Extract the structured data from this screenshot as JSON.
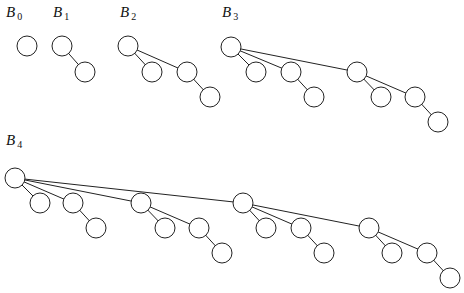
{
  "trees": [
    {
      "label": "B",
      "sub": "0",
      "lx": 6,
      "ly": 4,
      "nodes": [
        [
          27,
          46
        ]
      ],
      "edges": []
    },
    {
      "label": "B",
      "sub": "1",
      "lx": 53,
      "ly": 4,
      "nodes": [
        [
          62,
          46
        ],
        [
          85,
          72
        ]
      ],
      "edges": [
        [
          0,
          1
        ]
      ]
    },
    {
      "label": "B",
      "sub": "2",
      "lx": 120,
      "ly": 4,
      "nodes": [
        [
          128,
          46
        ],
        [
          152,
          72
        ],
        [
          187,
          72
        ],
        [
          210,
          97
        ]
      ],
      "edges": [
        [
          0,
          1
        ],
        [
          0,
          2
        ],
        [
          2,
          3
        ]
      ]
    },
    {
      "label": "B",
      "sub": "3",
      "lx": 222,
      "ly": 4,
      "nodes": [
        [
          231,
          47
        ],
        [
          256,
          72
        ],
        [
          291,
          72
        ],
        [
          314,
          97
        ],
        [
          357,
          72
        ],
        [
          381,
          97
        ],
        [
          415,
          97
        ],
        [
          438,
          122
        ]
      ],
      "edges": [
        [
          0,
          1
        ],
        [
          0,
          2
        ],
        [
          2,
          3
        ],
        [
          0,
          4
        ],
        [
          4,
          5
        ],
        [
          4,
          6
        ],
        [
          6,
          7
        ]
      ]
    },
    {
      "label": "B",
      "sub": "4",
      "lx": 6,
      "ly": 132,
      "nodes": [
        [
          15,
          178
        ],
        [
          40,
          203
        ],
        [
          73,
          203
        ],
        [
          96,
          228
        ],
        [
          141,
          203
        ],
        [
          165,
          228
        ],
        [
          199,
          228
        ],
        [
          222,
          253
        ],
        [
          243,
          203
        ],
        [
          266,
          228
        ],
        [
          301,
          228
        ],
        [
          324,
          253
        ],
        [
          369,
          228
        ],
        [
          392,
          253
        ],
        [
          427,
          253
        ],
        [
          450,
          278
        ]
      ],
      "edges": [
        [
          0,
          1
        ],
        [
          0,
          2
        ],
        [
          2,
          3
        ],
        [
          0,
          4
        ],
        [
          4,
          5
        ],
        [
          4,
          6
        ],
        [
          6,
          7
        ],
        [
          0,
          8
        ],
        [
          8,
          9
        ],
        [
          8,
          10
        ],
        [
          10,
          11
        ],
        [
          8,
          12
        ],
        [
          12,
          13
        ],
        [
          12,
          14
        ],
        [
          14,
          15
        ]
      ]
    }
  ],
  "node_radius": 10
}
